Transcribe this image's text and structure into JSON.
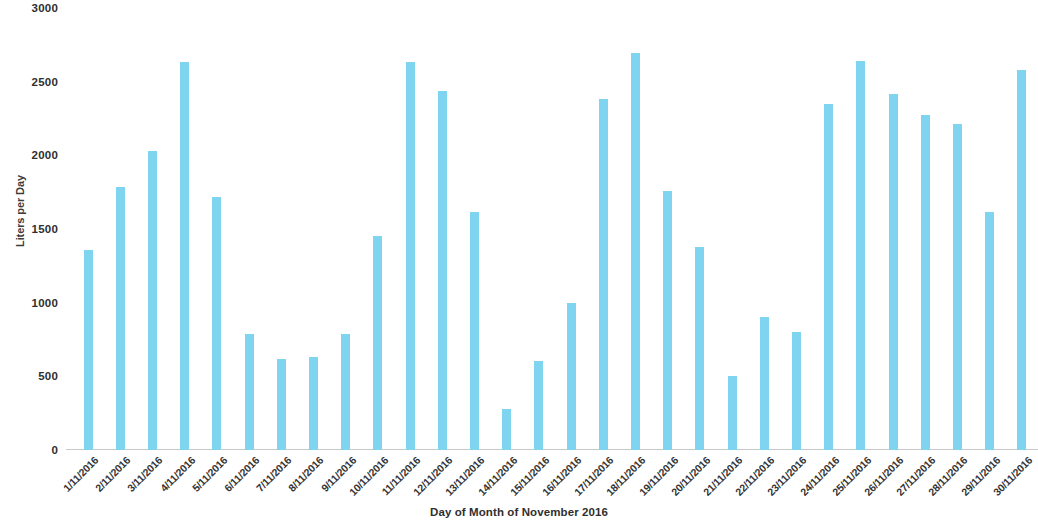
{
  "chart_data": {
    "type": "bar",
    "title": "",
    "xlabel": "Day of Month of November 2016",
    "ylabel": "Liters per Day",
    "ylim": [
      0,
      3000
    ],
    "yticks": [
      0,
      500,
      1000,
      1500,
      2000,
      2500,
      3000
    ],
    "ytick_labels": [
      "0",
      "500",
      "1000",
      "1500",
      "2000",
      "2500",
      "3000"
    ],
    "grid": false,
    "legend": "none",
    "bar_color": "#7FD5EF",
    "axis_line_color": "#C9C9C9",
    "categories": [
      "1/11/2016",
      "2/11/2016",
      "3/11/2016",
      "4/11/2016",
      "5/11/2016",
      "6/11/2016",
      "7/11/2016",
      "8/11/2016",
      "9/11/2016",
      "10/11/2016",
      "11/11/2016",
      "12/11/2016",
      "13/11/2016",
      "14/11/2016",
      "15/11/2016",
      "16/11/2016",
      "17/11/2016",
      "18/11/2016",
      "19/11/2016",
      "20/11/2016",
      "21/11/2016",
      "22/11/2016",
      "23/11/2016",
      "24/11/2016",
      "25/11/2016",
      "26/11/2016",
      "27/11/2016",
      "28/11/2016",
      "29/11/2016",
      "30/11/2016"
    ],
    "values": [
      1355,
      1785,
      2030,
      2635,
      1715,
      790,
      615,
      630,
      785,
      1450,
      2635,
      2435,
      1615,
      280,
      605,
      1000,
      2380,
      2695,
      1755,
      1380,
      500,
      905,
      800,
      2350,
      2640,
      2415,
      2275,
      2215,
      1615,
      2580
    ]
  }
}
